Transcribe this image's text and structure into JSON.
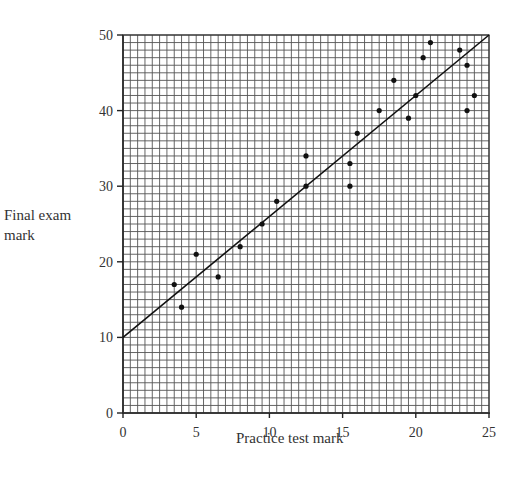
{
  "chart_data": {
    "type": "scatter",
    "title": "",
    "xlabel": "Practice test mark",
    "ylabel": "Final exam mark",
    "xlim": [
      0,
      25
    ],
    "ylim": [
      0,
      50
    ],
    "xticks": [
      0,
      5,
      10,
      15,
      20,
      25
    ],
    "yticks": [
      0,
      10,
      20,
      30,
      40,
      50
    ],
    "grid": {
      "on": true,
      "x_minor_step": 0.5,
      "y_minor_step": 1
    },
    "legend": null,
    "series": [
      {
        "name": "students",
        "points": [
          [
            3.5,
            17
          ],
          [
            4,
            14
          ],
          [
            5,
            21
          ],
          [
            6.5,
            18
          ],
          [
            8,
            22
          ],
          [
            9.5,
            25
          ],
          [
            10.5,
            28
          ],
          [
            12.5,
            34
          ],
          [
            12.5,
            30
          ],
          [
            15.5,
            33
          ],
          [
            15.5,
            30
          ],
          [
            16,
            37
          ],
          [
            17.5,
            40
          ],
          [
            18.5,
            44
          ],
          [
            19.5,
            39
          ],
          [
            20,
            42
          ],
          [
            20.5,
            47
          ],
          [
            21,
            49
          ],
          [
            23,
            48
          ],
          [
            23.5,
            46
          ],
          [
            23.5,
            40
          ],
          [
            24,
            42
          ]
        ]
      }
    ],
    "line_of_best_fit": {
      "from": [
        0,
        10
      ],
      "to": [
        25,
        50
      ]
    }
  },
  "labels": {
    "ylabel_line1": "Final exam",
    "ylabel_line2": "mark",
    "xlabel": "Practice test mark"
  }
}
